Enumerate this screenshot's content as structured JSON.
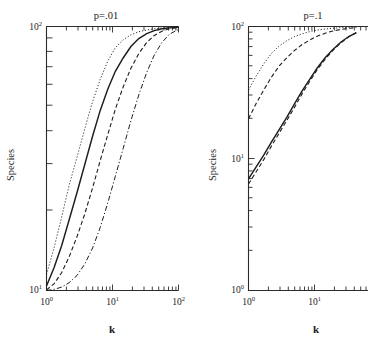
{
  "figure": {
    "width": 368,
    "height": 349,
    "background": "#ffffff",
    "ink_color": "#1d1d1d"
  },
  "chart_data": [
    {
      "type": "line",
      "title": "p=.01",
      "xlabel": "k",
      "ylabel": "Species",
      "xscale": "log",
      "yscale": "log",
      "xlim": [
        1,
        100
      ],
      "ylim": [
        10,
        100
      ],
      "xticks": [
        "10⁰",
        "10¹",
        "10²"
      ],
      "xtick_values": [
        1,
        10,
        100
      ],
      "yticks": [
        "10¹",
        "10²"
      ],
      "ytick_values": [
        10,
        100
      ],
      "grid": false,
      "legend": "none",
      "series": [
        {
          "name": "curve-1",
          "style": "dotted",
          "x": [
            1,
            1.3,
            1.7,
            2.2,
            2.9,
            3.8,
            5,
            6.5,
            8.5,
            11,
            14.5,
            19,
            25,
            33,
            43,
            56,
            73,
            100
          ],
          "y": [
            11.5,
            14.5,
            19,
            25,
            32,
            41,
            52,
            63,
            74,
            83,
            89,
            93,
            95.5,
            97,
            98,
            98.7,
            99.2,
            99.6
          ]
        },
        {
          "name": "curve-2",
          "style": "solid",
          "x": [
            1,
            1.3,
            1.7,
            2.2,
            2.9,
            3.8,
            5,
            6.5,
            8.5,
            11,
            14.5,
            19,
            25,
            33,
            43,
            56,
            73,
            100
          ],
          "y": [
            10.4,
            12.2,
            14.8,
            18.5,
            23.5,
            30,
            38.5,
            48,
            58,
            67.5,
            76,
            84,
            90,
            94,
            96.5,
            98,
            98.8,
            99.4
          ]
        },
        {
          "name": "curve-3",
          "style": "dashed",
          "x": [
            1,
            1.3,
            1.7,
            2.2,
            2.9,
            3.8,
            5,
            6.5,
            8.5,
            11,
            14.5,
            19,
            25,
            33,
            43,
            56,
            73,
            100
          ],
          "y": [
            10.05,
            10.6,
            11.7,
            13.4,
            16,
            19.5,
            24.5,
            31,
            39,
            48.5,
            59,
            69.5,
            79,
            87,
            92.5,
            96,
            98,
            99.2
          ]
        },
        {
          "name": "curve-4",
          "style": "dashdot",
          "x": [
            1,
            1.3,
            1.7,
            2.2,
            2.9,
            3.8,
            5,
            6.5,
            8.5,
            11,
            14.5,
            19,
            25,
            33,
            43,
            56,
            73,
            100
          ],
          "y": [
            10.0,
            10.1,
            10.3,
            10.7,
            11.4,
            12.6,
            14.5,
            17.3,
            21.5,
            27,
            34.5,
            44,
            55,
            67,
            78,
            87,
            93.5,
            97.5
          ]
        }
      ]
    },
    {
      "type": "line",
      "title": "p=.1",
      "xlabel": "k",
      "ylabel": "Species",
      "xscale": "log",
      "yscale": "log",
      "xlim": [
        1,
        100
      ],
      "ylim": [
        1,
        100
      ],
      "xticks": [
        "10⁰",
        "10¹"
      ],
      "xtick_values": [
        1,
        10
      ],
      "yticks": [
        "10⁰",
        "10¹",
        "10²"
      ],
      "ytick_values": [
        1,
        10,
        100
      ],
      "grid": false,
      "legend": "none",
      "clipped_right_edge": true,
      "series": [
        {
          "name": "curve-1",
          "style": "dotted",
          "x": [
            1,
            1.3,
            1.7,
            2.2,
            2.9,
            3.8,
            5,
            6.5,
            8.5,
            11,
            14.5,
            19,
            25,
            33,
            43
          ],
          "y": [
            33,
            42,
            52,
            62,
            71,
            78,
            84,
            88,
            91.5,
            94,
            95.8,
            97,
            98,
            98.6,
            99.1
          ]
        },
        {
          "name": "curve-2",
          "style": "dashed",
          "x": [
            1,
            1.3,
            1.7,
            2.2,
            2.9,
            3.8,
            5,
            6.5,
            8.5,
            11,
            14.5,
            19,
            25,
            33,
            43
          ],
          "y": [
            20,
            26,
            33,
            41,
            50,
            58,
            66,
            73,
            79,
            84.5,
            89,
            92.5,
            95,
            96.8,
            98
          ]
        },
        {
          "name": "curve-3",
          "style": "solid",
          "x": [
            1,
            1.3,
            1.7,
            2.2,
            2.9,
            3.8,
            5,
            6.5,
            8.5,
            11,
            14.5,
            19,
            25,
            33,
            43
          ],
          "y": [
            7.0,
            8.6,
            10.6,
            13.2,
            16.5,
            20.5,
            26,
            32.5,
            40,
            48.5,
            58,
            67,
            76,
            84,
            90
          ]
        },
        {
          "name": "curve-4",
          "style": "dashed",
          "x": [
            1,
            1.3,
            1.7,
            2.2,
            2.9,
            3.8,
            5,
            6.5,
            8.5,
            11,
            14.5,
            19,
            25,
            33,
            43
          ],
          "y": [
            6.4,
            7.9,
            9.8,
            12.3,
            15.5,
            19.4,
            24.5,
            31,
            38.5,
            47,
            56.5,
            66,
            75,
            83.5,
            89.5
          ]
        }
      ]
    }
  ],
  "panels": {
    "left": {
      "title": "p=.01",
      "xlabel": "k",
      "ylabel": "Species",
      "x_tick_labels": [
        {
          "mant": "10",
          "exp": "0"
        },
        {
          "mant": "10",
          "exp": "1"
        },
        {
          "mant": "10",
          "exp": "2"
        }
      ],
      "y_tick_labels": [
        {
          "mant": "10",
          "exp": "2"
        },
        {
          "mant": "10",
          "exp": "1"
        }
      ]
    },
    "right": {
      "title": "p=.1",
      "xlabel": "k",
      "ylabel": "Species",
      "x_tick_labels": [
        {
          "mant": "10",
          "exp": "0"
        },
        {
          "mant": "10",
          "exp": "1"
        }
      ],
      "y_tick_labels": [
        {
          "mant": "10",
          "exp": "2"
        },
        {
          "mant": "10",
          "exp": "1"
        },
        {
          "mant": "10",
          "exp": "0"
        }
      ]
    }
  }
}
